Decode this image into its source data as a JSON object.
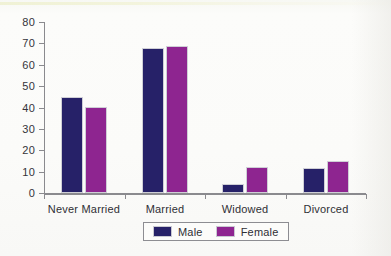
{
  "chart_data": {
    "type": "bar",
    "title": "",
    "xlabel": "",
    "ylabel": "",
    "ylim": [
      0,
      80
    ],
    "ytick_step": 10,
    "yticks": [
      80,
      70,
      60,
      50,
      40,
      30,
      20,
      10,
      0
    ],
    "grid": false,
    "legend_position": "bottom",
    "categories": [
      "Never Married",
      "Married",
      "Widowed",
      "Divorced"
    ],
    "series": [
      {
        "name": "Male",
        "color": "#262168",
        "values": [
          45,
          68,
          4,
          11.5
        ]
      },
      {
        "name": "Female",
        "color": "#8e2590",
        "values": [
          40,
          69,
          12,
          15
        ]
      }
    ]
  },
  "legend": {
    "items": [
      {
        "label": "Male"
      },
      {
        "label": "Female"
      }
    ]
  },
  "colors": {
    "male": "#262168",
    "female": "#8e2590",
    "axis": "#8a8a8e",
    "text": "#2f2f35",
    "background": "#fbfbf8"
  }
}
